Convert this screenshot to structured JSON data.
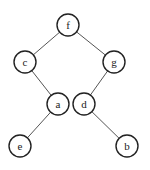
{
  "diagram": {
    "type": "binary-tree",
    "nodes": [
      {
        "id": "f",
        "label": "f",
        "x": 68,
        "y": 25
      },
      {
        "id": "c",
        "label": "c",
        "x": 25,
        "y": 62
      },
      {
        "id": "g",
        "label": "g",
        "x": 114,
        "y": 62
      },
      {
        "id": "a",
        "label": "a",
        "x": 58,
        "y": 104
      },
      {
        "id": "d",
        "label": "d",
        "x": 84,
        "y": 104
      },
      {
        "id": "e",
        "label": "e",
        "x": 20,
        "y": 146
      },
      {
        "id": "b",
        "label": "b",
        "x": 127,
        "y": 146
      }
    ],
    "edges": [
      {
        "from": "f",
        "to": "c"
      },
      {
        "from": "f",
        "to": "g"
      },
      {
        "from": "c",
        "to": "a"
      },
      {
        "from": "g",
        "to": "d"
      },
      {
        "from": "a",
        "to": "e"
      },
      {
        "from": "d",
        "to": "b"
      }
    ]
  }
}
